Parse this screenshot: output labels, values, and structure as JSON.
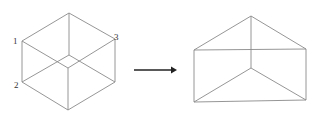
{
  "diagram": {
    "title": "",
    "cube": {
      "labels": [
        {
          "id": "1",
          "text": "1",
          "x": 13,
          "y": 44
        },
        {
          "id": "2",
          "text": "2",
          "x": 14,
          "y": 88
        },
        {
          "id": "3",
          "text": "3",
          "x": 114,
          "y": 40
        }
      ]
    },
    "arrow": {
      "direction": "right"
    },
    "prism": {
      "description": "triangular prism shown after transformation"
    }
  },
  "colors": {
    "edge": "#8a8a8a",
    "arrow": "#222222",
    "background": "#ffffff"
  }
}
